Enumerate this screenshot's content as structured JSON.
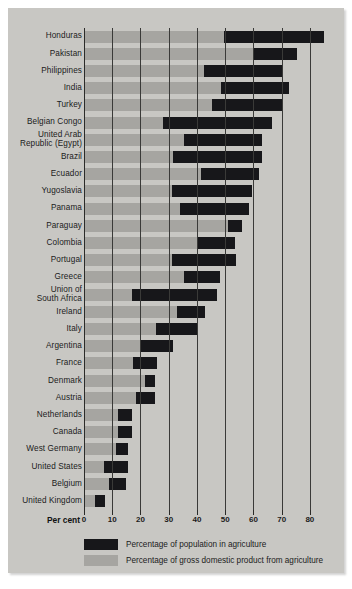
{
  "chart_data": {
    "type": "bar",
    "title": "",
    "subtitle": "",
    "xlabel": "Per cent",
    "ylabel": "",
    "xlim": [
      0,
      85
    ],
    "grid": true,
    "orientation": "horizontal",
    "bar_style": "floating-range",
    "xticks": [
      0,
      10,
      20,
      30,
      40,
      50,
      60,
      70,
      80
    ],
    "xticklabels": [
      "0",
      "10",
      "20",
      "30",
      "40",
      "50",
      "60",
      "70",
      "80"
    ],
    "legend_position": "bottom",
    "legend": [
      "Percentage of population in agriculture",
      "Percentage of gross domestic product from agriculture"
    ],
    "series": [
      {
        "name": "Percentage of gross domestic product from agriculture",
        "color": "#a6a5a1"
      },
      {
        "name": "Percentage of population in agriculture",
        "color": "#17171a"
      }
    ],
    "categories": [
      "Honduras",
      "Pakistan",
      "Philippines",
      "India",
      "Turkey",
      "Belgian Congo",
      "United Arab Republic (Egypt)",
      "Brazil",
      "Ecuador",
      "Yugoslavia",
      "Panama",
      "Paraguay",
      "Colombia",
      "Portugal",
      "Greece",
      "Union of South Africa",
      "Ireland",
      "Italy",
      "Argentina",
      "France",
      "Denmark",
      "Austria",
      "Netherlands",
      "Canada",
      "West Germany",
      "United States",
      "Belgium",
      "United Kingdom"
    ],
    "rows": [
      {
        "label": "Honduras",
        "label_lines": [
          "Honduras"
        ],
        "gdp": 49.5,
        "pop": 85.0
      },
      {
        "label": "Pakistan",
        "label_lines": [
          "Pakistan"
        ],
        "gdp": 60.0,
        "pop": 75.5
      },
      {
        "label": "Philippines",
        "label_lines": [
          "Philippines"
        ],
        "gdp": 42.5,
        "pop": 70.0
      },
      {
        "label": "India",
        "label_lines": [
          "India"
        ],
        "gdp": 48.5,
        "pop": 72.5
      },
      {
        "label": "Turkey",
        "label_lines": [
          "Turkey"
        ],
        "gdp": 45.5,
        "pop": 70.0
      },
      {
        "label": "Belgian Congo",
        "label_lines": [
          "Belgian Congo"
        ],
        "gdp": 28.0,
        "pop": 66.5
      },
      {
        "label": "United Arab Republic (Egypt)",
        "label_lines": [
          "United Arab",
          "Republic (Egypt)"
        ],
        "gdp": 35.5,
        "pop": 63.0
      },
      {
        "label": "Brazil",
        "label_lines": [
          "Brazil"
        ],
        "gdp": 31.5,
        "pop": 63.0
      },
      {
        "label": "Ecuador",
        "label_lines": [
          "Ecuador"
        ],
        "gdp": 41.5,
        "pop": 62.0
      },
      {
        "label": "Yugoslavia",
        "label_lines": [
          "Yugoslavia"
        ],
        "gdp": 31.0,
        "pop": 59.5
      },
      {
        "label": "Panama",
        "label_lines": [
          "Panama"
        ],
        "gdp": 34.0,
        "pop": 58.5
      },
      {
        "label": "Paraguay",
        "label_lines": [
          "Paraguay"
        ],
        "gdp": 51.0,
        "pop": 56.0
      },
      {
        "label": "Colombia",
        "label_lines": [
          "Colombia"
        ],
        "gdp": 40.0,
        "pop": 53.5
      },
      {
        "label": "Portugal",
        "label_lines": [
          "Portugal"
        ],
        "gdp": 31.0,
        "pop": 54.0
      },
      {
        "label": "Greece",
        "label_lines": [
          "Greece"
        ],
        "gdp": 35.5,
        "pop": 48.0
      },
      {
        "label": "Union of South Africa",
        "label_lines": [
          "Union of",
          "South Africa"
        ],
        "gdp": 17.0,
        "pop": 47.0
      },
      {
        "label": "Ireland",
        "label_lines": [
          "Ireland"
        ],
        "gdp": 33.0,
        "pop": 43.0
      },
      {
        "label": "Italy",
        "label_lines": [
          "Italy"
        ],
        "gdp": 25.5,
        "pop": 40.0
      },
      {
        "label": "Argentina",
        "label_lines": [
          "Argentina"
        ],
        "gdp": 20.0,
        "pop": 31.5
      },
      {
        "label": "France",
        "label_lines": [
          "France"
        ],
        "gdp": 17.5,
        "pop": 26.0
      },
      {
        "label": "Denmark",
        "label_lines": [
          "Denmark"
        ],
        "gdp": 21.5,
        "pop": 25.0
      },
      {
        "label": "Austria",
        "label_lines": [
          "Austria"
        ],
        "gdp": 18.5,
        "pop": 25.0
      },
      {
        "label": "Netherlands",
        "label_lines": [
          "Netherlands"
        ],
        "gdp": 12.0,
        "pop": 17.0
      },
      {
        "label": "Canada",
        "label_lines": [
          "Canada"
        ],
        "gdp": 12.0,
        "pop": 17.0
      },
      {
        "label": "West Germany",
        "label_lines": [
          "West Germany"
        ],
        "gdp": 11.5,
        "pop": 15.5
      },
      {
        "label": "United States",
        "label_lines": [
          "United States"
        ],
        "gdp": 7.0,
        "pop": 15.5
      },
      {
        "label": "Belgium",
        "label_lines": [
          "Belgium"
        ],
        "gdp": 9.0,
        "pop": 15.0
      },
      {
        "label": "United Kingdom",
        "label_lines": [
          "United Kingdom"
        ],
        "gdp": 4.0,
        "pop": 7.5
      }
    ]
  },
  "axis": {
    "percent_label": "Per cent"
  },
  "legend": {
    "population": "Percentage of population in agriculture",
    "gdp": "Percentage of gross domestic product from agriculture"
  },
  "colors": {
    "population": "#17171a",
    "gdp": "#a6a5a1",
    "background": "#c8c7c3",
    "grid": "#3a3a38"
  }
}
